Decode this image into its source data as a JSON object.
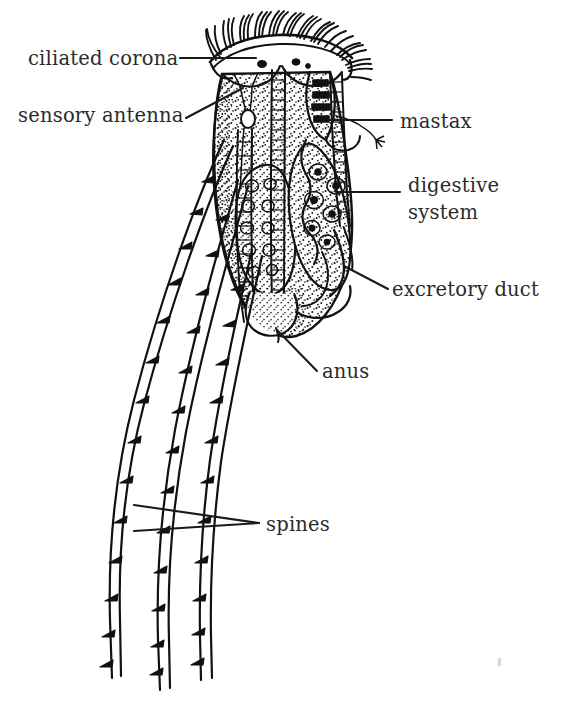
{
  "figure": {
    "organism": "rotifer",
    "style": "black-and-white line drawing with stippling",
    "background_color": "#ffffff",
    "ink_color": "#111111",
    "label_color": "#2b2b2b"
  },
  "labels": [
    {
      "id": "ciliated-corona",
      "text": "ciliated corona",
      "side": "left",
      "text_x": 28,
      "text_y": 65,
      "anchor": "start",
      "leader": {
        "type": "line",
        "x1": 180,
        "y1": 58,
        "x2": 256,
        "y2": 58
      }
    },
    {
      "id": "sensory-antenna",
      "text": "sensory antenna",
      "side": "left",
      "text_x": 18,
      "text_y": 122,
      "anchor": "start",
      "leader": {
        "type": "line",
        "x1": 186,
        "y1": 118,
        "x2": 243,
        "y2": 88
      }
    },
    {
      "id": "mastax",
      "text": "mastax",
      "side": "right",
      "text_x": 400,
      "text_y": 128,
      "anchor": "start",
      "leader": {
        "type": "line",
        "x1": 329,
        "y1": 120,
        "x2": 392,
        "y2": 120
      }
    },
    {
      "id": "digestive-system",
      "text": "digestive",
      "text_line2": "system",
      "side": "right",
      "text_x": 408,
      "text_y": 192,
      "text_y2": 219,
      "anchor": "start",
      "leader": {
        "type": "line",
        "x1": 338,
        "y1": 192,
        "x2": 400,
        "y2": 192
      }
    },
    {
      "id": "excretory-duct",
      "text": "excretory duct",
      "side": "right",
      "text_x": 392,
      "text_y": 296,
      "anchor": "start",
      "leader": {
        "type": "line",
        "x1": 344,
        "y1": 266,
        "x2": 388,
        "y2": 289
      }
    },
    {
      "id": "anus",
      "text": "anus",
      "side": "right",
      "text_x": 322,
      "text_y": 378,
      "anchor": "start",
      "leader": {
        "type": "line",
        "x1": 277,
        "y1": 330,
        "x2": 317,
        "y2": 371
      }
    },
    {
      "id": "spines",
      "text": "spines",
      "side": "right",
      "text_x": 266,
      "text_y": 531,
      "anchor": "start",
      "leader": {
        "type": "wedge",
        "x1": 134,
        "y1": 505,
        "x2": 134,
        "y2": 531,
        "tip_x": 259,
        "tip_y": 523
      }
    }
  ],
  "structures": {
    "corona_cilia_count": 34,
    "spine_count": 3,
    "spine_barbs_per_spine": 14,
    "body_outline": "oval vase-shaped trunk",
    "internal_organs": [
      "mastax",
      "digestive system",
      "excretory duct",
      "anus",
      "sensory antenna"
    ]
  }
}
